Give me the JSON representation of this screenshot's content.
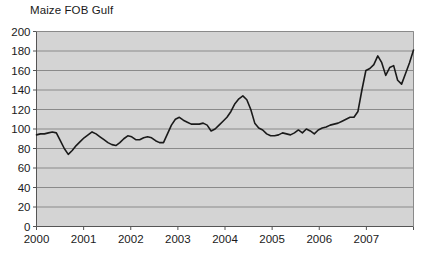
{
  "chart_data": {
    "type": "line",
    "title": "Maize FOB Gulf",
    "xlabel": "",
    "ylabel": "",
    "ylim": [
      0,
      200
    ],
    "ytick_step": 20,
    "yticks": [
      0,
      20,
      40,
      60,
      80,
      100,
      120,
      140,
      160,
      180,
      200
    ],
    "xticks": [
      "2000",
      "2001",
      "2002",
      "2003",
      "2004",
      "2005",
      "2006",
      "2007"
    ],
    "xlim": [
      "2000-01",
      "2007-12"
    ],
    "grid": "horizontal",
    "legend": "none",
    "plot_bgcolor": "#d4d4d4",
    "gridline_color": "#8a8a8a",
    "line_color": "#1a1a1a",
    "line_width": 1.6,
    "series": [
      {
        "name": "Maize FOB Gulf",
        "x": [
          "2000-01",
          "2000-02",
          "2000-03",
          "2000-04",
          "2000-05",
          "2000-06",
          "2000-07",
          "2000-08",
          "2000-09",
          "2000-10",
          "2000-11",
          "2000-12",
          "2001-01",
          "2001-02",
          "2001-03",
          "2001-04",
          "2001-05",
          "2001-06",
          "2001-07",
          "2001-08",
          "2001-09",
          "2001-10",
          "2001-11",
          "2001-12",
          "2002-01",
          "2002-02",
          "2002-03",
          "2002-04",
          "2002-05",
          "2002-06",
          "2002-07",
          "2002-08",
          "2002-09",
          "2002-10",
          "2002-11",
          "2002-12",
          "2003-01",
          "2003-02",
          "2003-03",
          "2003-04",
          "2003-05",
          "2003-06",
          "2003-07",
          "2003-08",
          "2003-09",
          "2003-10",
          "2003-11",
          "2003-12",
          "2004-01",
          "2004-02",
          "2004-03",
          "2004-04",
          "2004-05",
          "2004-06",
          "2004-07",
          "2004-08",
          "2004-09",
          "2004-10",
          "2004-11",
          "2004-12",
          "2005-01",
          "2005-02",
          "2005-03",
          "2005-04",
          "2005-05",
          "2005-06",
          "2005-07",
          "2005-08",
          "2005-09",
          "2005-10",
          "2005-11",
          "2005-12",
          "2006-01",
          "2006-02",
          "2006-03",
          "2006-04",
          "2006-05",
          "2006-06",
          "2006-07",
          "2006-08",
          "2006-09",
          "2006-10",
          "2006-11",
          "2006-12",
          "2007-01",
          "2007-02",
          "2007-03",
          "2007-04",
          "2007-05",
          "2007-06",
          "2007-07",
          "2007-08",
          "2007-09",
          "2007-10",
          "2007-11",
          "2007-12"
        ],
        "values": [
          94,
          95,
          95,
          96,
          97,
          96,
          88,
          80,
          74,
          78,
          83,
          87,
          91,
          94,
          97,
          95,
          92,
          89,
          86,
          84,
          83,
          86,
          90,
          93,
          92,
          89,
          89,
          91,
          92,
          91,
          88,
          86,
          86,
          95,
          104,
          110,
          112,
          109,
          107,
          105,
          105,
          105,
          106,
          104,
          98,
          100,
          104,
          108,
          112,
          118,
          126,
          131,
          134,
          130,
          120,
          106,
          101,
          99,
          95,
          93,
          93,
          94,
          96,
          95,
          94,
          96,
          99,
          96,
          100,
          98,
          95,
          99,
          101,
          102,
          104,
          105,
          106,
          108,
          110,
          112,
          112,
          118,
          140,
          160,
          162,
          166,
          175,
          168,
          155,
          163,
          165,
          150,
          146,
          157,
          168,
          181
        ]
      }
    ]
  }
}
